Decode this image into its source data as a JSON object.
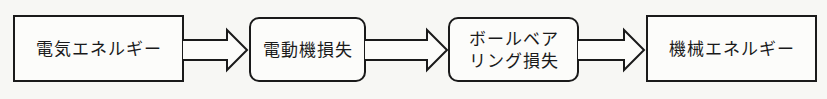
{
  "diagram": {
    "type": "flowchart",
    "direction": "left-to-right",
    "nodes": [
      {
        "id": "electric-energy",
        "label": "電気エネルギー",
        "shape": "rectangle"
      },
      {
        "id": "motor-loss",
        "label": "電動機損失",
        "shape": "rounded-rectangle"
      },
      {
        "id": "ball-bearing-loss",
        "label_lines": [
          "ボールベア",
          "リング損失"
        ],
        "label": "ボールベアリング損失",
        "shape": "rounded-rectangle"
      },
      {
        "id": "mechanical-energy",
        "label": "機械エネルギー",
        "shape": "rectangle"
      }
    ],
    "edges": [
      {
        "from": "electric-energy",
        "to": "motor-loss",
        "style": "block-arrow"
      },
      {
        "from": "motor-loss",
        "to": "ball-bearing-loss",
        "style": "block-arrow"
      },
      {
        "from": "ball-bearing-loss",
        "to": "mechanical-energy",
        "style": "block-arrow"
      }
    ]
  },
  "colors": {
    "stroke": "#1a1a1a",
    "background": "#f7f7f4"
  }
}
